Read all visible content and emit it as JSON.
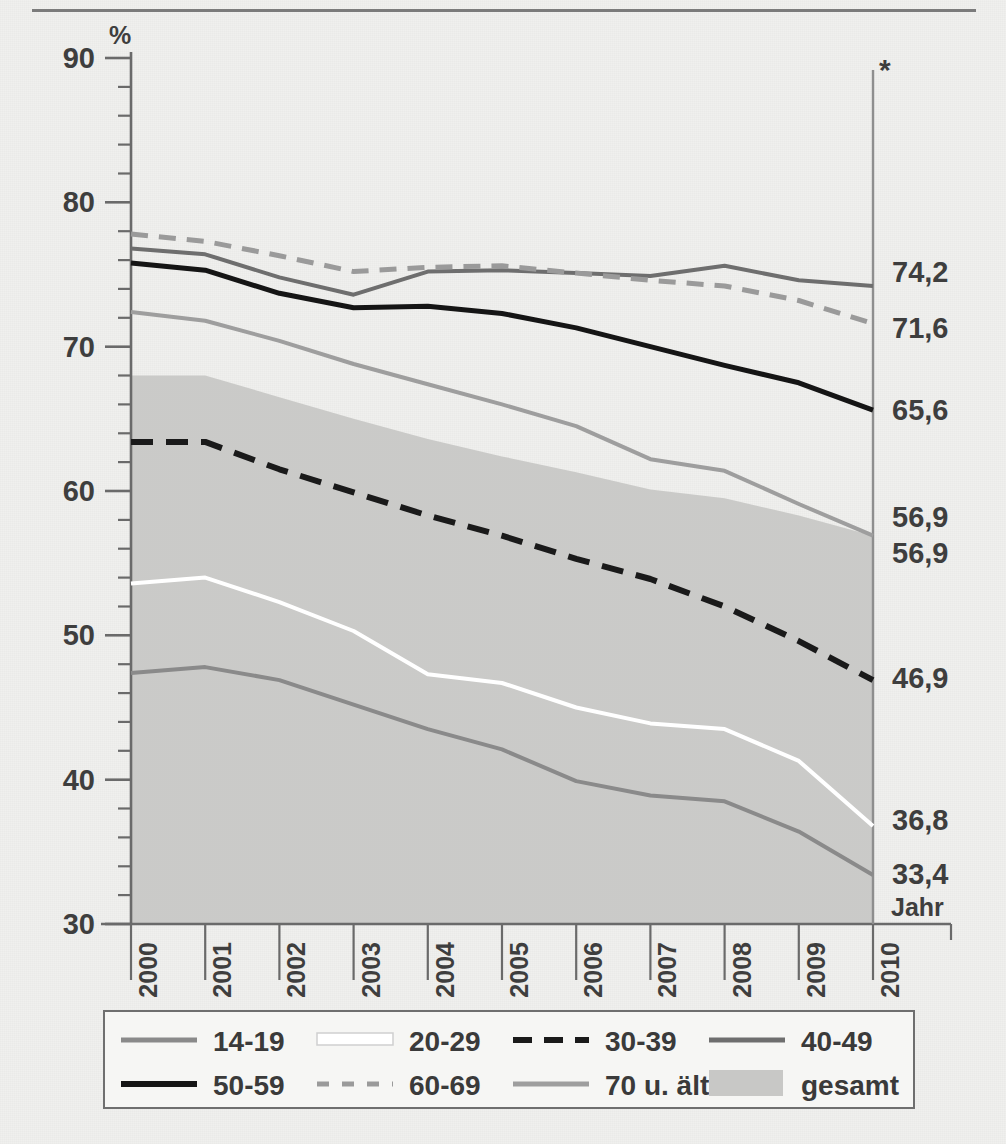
{
  "chart_data": {
    "type": "line",
    "title": "",
    "xlabel": "Jahr",
    "ylabel": "%",
    "x": [
      2000,
      2001,
      2002,
      2003,
      2004,
      2005,
      2006,
      2007,
      2008,
      2009,
      2010
    ],
    "xticklabels": [
      "2000",
      "2001",
      "2002",
      "2003",
      "2004",
      "2005",
      "2006",
      "2007",
      "2008",
      "2009",
      "2010"
    ],
    "ylim": [
      30,
      90
    ],
    "yticks": [
      30,
      40,
      50,
      60,
      70,
      80,
      90
    ],
    "yticklabels": [
      "30",
      "40",
      "50",
      "60",
      "70",
      "80",
      "90"
    ],
    "minor_tick_step": 2,
    "grid": false,
    "legend_position": "below",
    "annotation_marker": "*",
    "annotation_year": 2010,
    "series": [
      {
        "name": "14-19",
        "color": "#8a8a8a",
        "style": "solid",
        "width": 4,
        "values": [
          47.4,
          47.8,
          46.9,
          45.2,
          43.5,
          42.1,
          39.9,
          38.9,
          38.5,
          36.4,
          33.4
        ],
        "end_label": "33,4"
      },
      {
        "name": "20-29",
        "color": "#ffffff",
        "style": "solid",
        "width": 4,
        "values": [
          53.6,
          54.0,
          52.3,
          50.3,
          47.3,
          46.7,
          45.0,
          43.9,
          43.5,
          41.3,
          36.8
        ],
        "end_label": "36,8"
      },
      {
        "name": "30-39",
        "color": "#1a1a1a",
        "style": "dashed",
        "width": 6,
        "values": [
          63.4,
          63.4,
          61.5,
          59.9,
          58.3,
          56.9,
          55.3,
          53.9,
          52.0,
          49.6,
          46.9
        ],
        "end_label": "46,9"
      },
      {
        "name": "40-49",
        "color": "#6e6e6e",
        "style": "solid",
        "width": 4,
        "values": [
          76.8,
          76.4,
          74.8,
          73.6,
          75.2,
          75.3,
          75.1,
          74.9,
          75.6,
          74.6,
          74.2
        ],
        "end_label": "74,2"
      },
      {
        "name": "50-59",
        "color": "#151515",
        "style": "solid",
        "width": 5,
        "values": [
          75.8,
          75.3,
          73.7,
          72.7,
          72.8,
          72.3,
          71.3,
          70.0,
          68.7,
          67.5,
          65.6
        ],
        "end_label": "65,6"
      },
      {
        "name": "60-69",
        "color": "#9a9a9a",
        "style": "dashed",
        "width": 5,
        "values": [
          77.8,
          77.3,
          76.3,
          75.2,
          75.5,
          75.6,
          75.1,
          74.6,
          74.2,
          73.2,
          71.6
        ],
        "end_label": "71,6"
      },
      {
        "name": "70 u. älter",
        "color": "#9e9e9e",
        "style": "solid",
        "width": 4,
        "values": [
          72.4,
          71.8,
          70.4,
          68.8,
          67.4,
          66.0,
          64.5,
          62.2,
          61.4,
          59.1,
          56.9
        ],
        "end_label": "56,9"
      },
      {
        "name": "gesamt",
        "color": "#c8c8c6",
        "style": "band",
        "width": 0,
        "values": [
          68.0,
          68.0,
          66.5,
          65.0,
          63.6,
          62.4,
          61.3,
          60.1,
          59.5,
          58.3,
          56.9
        ],
        "end_label": "56,9"
      }
    ],
    "end_labels": [
      "74,2",
      "71,6",
      "65,6",
      "56,9",
      "56,9",
      "46,9",
      "36,8",
      "33,4"
    ]
  },
  "axis": {
    "y_unit": "%",
    "x_title": "Jahr",
    "footnote_marker": "*"
  },
  "legend": {
    "items": [
      {
        "label": "14-19",
        "swatch": "line-solid-gray",
        "color": "#8a8a8a"
      },
      {
        "label": "20-29",
        "swatch": "line-solid-white",
        "color": "#ffffff"
      },
      {
        "label": "30-39",
        "swatch": "line-dashed-black",
        "color": "#1a1a1a"
      },
      {
        "label": "40-49",
        "swatch": "line-solid-midgray",
        "color": "#6e6e6e"
      },
      {
        "label": "50-59",
        "swatch": "line-solid-black",
        "color": "#151515"
      },
      {
        "label": "60-69",
        "swatch": "line-dashed-gray",
        "color": "#9a9a9a"
      },
      {
        "label": "70 u. älter",
        "swatch": "line-solid-lightgray",
        "color": "#9e9e9e"
      },
      {
        "label": "gesamt",
        "swatch": "area-fill",
        "color": "#c8c8c6"
      }
    ]
  }
}
